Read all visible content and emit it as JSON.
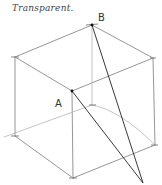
{
  "title": "Transparent.",
  "labels": {
    "A": "A",
    "B": "B"
  },
  "colors": {
    "sketch": "#8a8a8a",
    "ink": "#222222",
    "hidden": "#b5b5b5"
  }
}
